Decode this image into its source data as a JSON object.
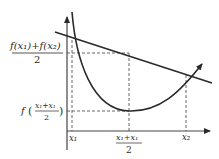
{
  "diagram": {
    "type": "convex-function-jensen",
    "labels": {
      "y_upper_numerator": "f(x₁)+f(x₂)",
      "y_upper_denominator": "2",
      "y_lower_f": "f",
      "y_lower_numerator": "x₁+x₁",
      "y_lower_denominator": "2",
      "x_left": "x₁",
      "x_mid_numerator": "x₁+x₁",
      "x_mid_denominator": "2",
      "x_right": "x₂"
    },
    "colors": {
      "stroke": "#2a2a2a",
      "dashed": "#555555",
      "background": "#ffffff"
    }
  }
}
